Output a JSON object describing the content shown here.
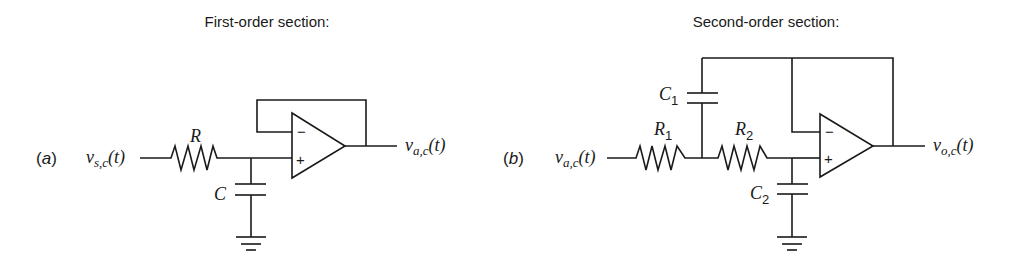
{
  "first_order": {
    "title": "First-order section:",
    "tag_open": "(",
    "tag_letter": "a",
    "tag_close": ")",
    "input_label": {
      "base": "v",
      "sub": "s,c",
      "arg": "(t)"
    },
    "output_label": {
      "base": "v",
      "sub": "a,c",
      "arg": "(t)"
    },
    "resistor": {
      "label": "R"
    },
    "capacitor": {
      "label": "C"
    },
    "opamp": {
      "minus": "−",
      "plus": "+"
    }
  },
  "second_order": {
    "title": "Second-order section:",
    "tag_open": "(",
    "tag_letter": "b",
    "tag_close": ")",
    "input_label": {
      "base": "v",
      "sub": "a,c",
      "arg": "(t)"
    },
    "output_label": {
      "base": "v",
      "sub": "o,c",
      "arg": "(t)"
    },
    "resistor1": {
      "label": "R",
      "sub": "1"
    },
    "resistor2": {
      "label": "R",
      "sub": "2"
    },
    "capacitor1": {
      "label": "C",
      "sub": "1"
    },
    "capacitor2": {
      "label": "C",
      "sub": "2"
    },
    "opamp": {
      "minus": "−",
      "plus": "+"
    }
  },
  "colors": {
    "ink": "#1a1a1a",
    "background": "#ffffff"
  }
}
